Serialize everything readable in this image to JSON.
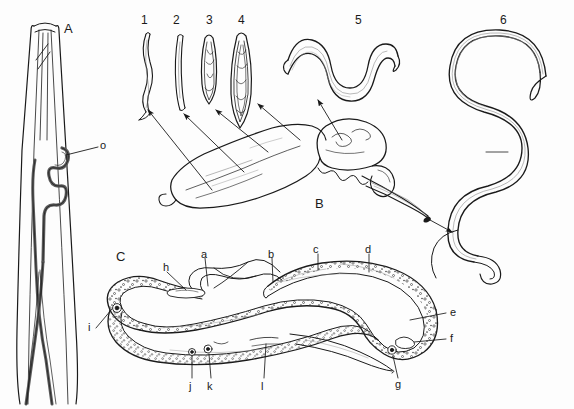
{
  "figure": {
    "background_color": "#fdfdfd",
    "ink_color": "#1a1a1a",
    "shading_color": "#8a8a8a",
    "width": 574,
    "height": 409
  },
  "panels": [
    {
      "key": "A",
      "label": "A",
      "x": 64,
      "y": 22,
      "description": "Anterior end longitudinal section showing coiled internal tube"
    },
    {
      "key": "B",
      "label": "B",
      "x": 315,
      "y": 197,
      "description": "Host organ with arrows to larval stages"
    },
    {
      "key": "C",
      "label": "C",
      "x": 116,
      "y": 250,
      "description": "Adult worm sagittal section with lettered structures"
    }
  ],
  "stage_numbers": [
    {
      "label": "1",
      "x": 141,
      "y": 14
    },
    {
      "label": "2",
      "x": 173,
      "y": 14
    },
    {
      "label": "3",
      "x": 206,
      "y": 14
    },
    {
      "label": "4",
      "x": 238,
      "y": 14
    },
    {
      "label": "5",
      "x": 355,
      "y": 14
    },
    {
      "label": "6",
      "x": 500,
      "y": 14
    }
  ],
  "panel_a_labels": [
    {
      "label": "o",
      "x": 88,
      "y": 140
    }
  ],
  "panel_c_labels": [
    {
      "label": "a",
      "x": 201,
      "y": 249
    },
    {
      "label": "b",
      "x": 268,
      "y": 249
    },
    {
      "label": "c",
      "x": 313,
      "y": 244
    },
    {
      "label": "d",
      "x": 365,
      "y": 244
    },
    {
      "label": "e",
      "x": 450,
      "y": 310
    },
    {
      "label": "f",
      "x": 450,
      "y": 336
    },
    {
      "label": "g",
      "x": 395,
      "y": 381
    },
    {
      "label": "h",
      "x": 163,
      "y": 263
    },
    {
      "label": "i",
      "x": 90,
      "y": 326
    },
    {
      "label": "j",
      "x": 189,
      "y": 384
    },
    {
      "label": "k",
      "x": 207,
      "y": 384
    },
    {
      "label": "l",
      "x": 261,
      "y": 384
    }
  ]
}
